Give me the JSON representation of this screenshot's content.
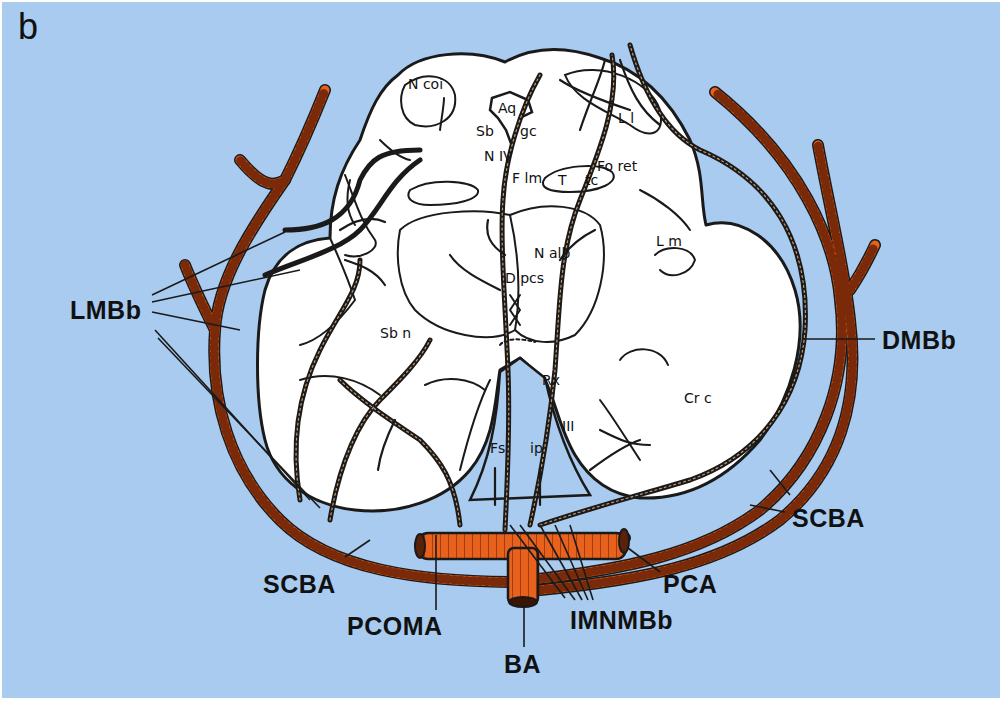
{
  "figure": {
    "panel_letter": "b",
    "background_color": "#a9cbef",
    "vessel_color": "#e8621e",
    "outline_color": "#1a1a1a",
    "tissue_color": "#ffffff"
  },
  "vessel_labels": {
    "lmbb": "LMBb",
    "dmbb": "DMBb",
    "scba_left": "SCBA",
    "scba_right": "SCBA",
    "pcoma": "PCOMA",
    "pca": "PCA",
    "imnmbb": "IMNMBb",
    "ba": "BA"
  },
  "structure_labels": {
    "n_coi": "N coi",
    "aq": "Aq",
    "sb_gc_sb": "Sb",
    "sb_gc_gc": "gc",
    "n_iv": "N IV",
    "f_lm": "F lm",
    "t_tc_t": "T",
    "t_tc_tc": "tc",
    "fo_ret": "Fo ret",
    "l_l": "L l",
    "l_m": "L m",
    "n_alb": "N alb",
    "d_pcs": "D pcs",
    "sb_n": "Sb n",
    "rx": "Rx",
    "fs": "Fs",
    "ip": "ip",
    "iii": "III",
    "cr_c": "Cr  c"
  }
}
